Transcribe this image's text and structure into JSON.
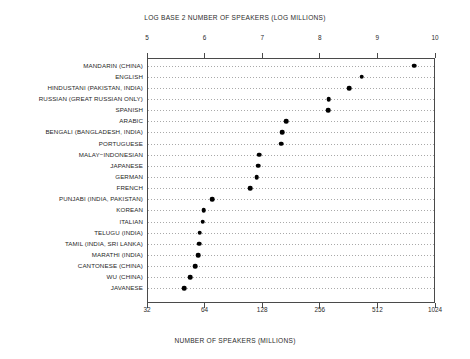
{
  "chart_data": {
    "type": "scatter",
    "title": "",
    "top_axis": {
      "label": "LOG BASE 2 NUMBER OF SPEAKERS (LOG MILLIONS)",
      "ticks": [
        "5",
        "6",
        "7",
        "8",
        "9",
        "10"
      ],
      "range": [
        5,
        10
      ]
    },
    "bottom_axis": {
      "label": "NUMBER OF SPEAKERS  (MILLIONS)",
      "ticks": [
        "32",
        "64",
        "128",
        "256",
        "512",
        "1024"
      ],
      "range": [
        32,
        1024
      ]
    },
    "xlabel": "NUMBER OF SPEAKERS  (MILLIONS)",
    "ylabel": "",
    "grid": true,
    "legend": "none",
    "categories": [
      "MANDARIN (CHINA)",
      "ENGLISH",
      "HINDUSTANI (PAKISTAN, INDIA)",
      "RUSSIAN (GREAT RUSSIAN ONLY)",
      "SPANISH",
      "ARABIC",
      "BENGALI (BANGLADESH, INDIA)",
      "PORTUGUESE",
      "MALAY−INDONESIAN",
      "JAPANESE",
      "GERMAN",
      "FRENCH",
      "PUNJABI (INDIA, PAKISTAN)",
      "KOREAN",
      "ITALIAN",
      "TELUGU (INDIA)",
      "TAMIL (INDIA, SRI LANKA)",
      "MARATHI (INDIA)",
      "CANTONESE  (CHINA)",
      "WU (CHINA)",
      "JAVANESE"
    ],
    "values": [
      9.62,
      8.71,
      8.49,
      8.14,
      8.13,
      7.4,
      7.33,
      7.31,
      6.93,
      6.91,
      6.89,
      6.77,
      6.11,
      5.97,
      5.95,
      5.9,
      5.89,
      5.87,
      5.82,
      5.73,
      5.63
    ],
    "values_millions": [
      787,
      419,
      359,
      282,
      279,
      169,
      161,
      159,
      122,
      121,
      119,
      109,
      69,
      63,
      62,
      60,
      59,
      58,
      56,
      53,
      50
    ]
  },
  "colors": {
    "marker": "#000000",
    "frame": "#4a4a4a",
    "grid": "#9a9a9a",
    "text": "#1f1f1f",
    "background": "#ffffff"
  }
}
